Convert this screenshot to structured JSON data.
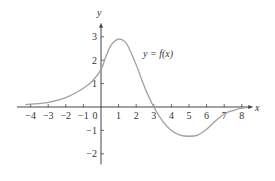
{
  "chart_data": {
    "type": "line",
    "title": "",
    "xlabel": "x",
    "ylabel": "y",
    "annotation": "y = f(x)",
    "xlim": [
      -4.5,
      8.5
    ],
    "ylim": [
      -2.5,
      3.6
    ],
    "grid": false,
    "x_ticks": [
      -4,
      -3,
      -2,
      -1,
      0,
      1,
      2,
      3,
      4,
      5,
      6,
      7,
      8
    ],
    "x_tick_labels": [
      "−4",
      "−3",
      "−2",
      "−1",
      "0",
      "1",
      "2",
      "3",
      "4",
      "5",
      "6",
      "7",
      "8"
    ],
    "y_ticks": [
      -2,
      -1,
      1,
      2,
      3
    ],
    "y_tick_labels": [
      "−2",
      "−1",
      "1",
      "2",
      "3"
    ],
    "series": [
      {
        "name": "y = f(x)",
        "color": "#a0a0a0",
        "x": [
          -4.3,
          -4,
          -3,
          -2,
          -1,
          -0.5,
          0,
          0.25,
          0.5,
          0.75,
          1,
          1.25,
          1.5,
          2,
          2.5,
          3,
          3.5,
          4,
          4.5,
          5,
          5.5,
          6,
          6.5,
          7,
          7.5,
          8,
          8.3
        ],
        "y": [
          0.1,
          0.12,
          0.2,
          0.4,
          0.8,
          1.1,
          1.6,
          2.1,
          2.55,
          2.8,
          2.9,
          2.85,
          2.65,
          1.8,
          0.8,
          0,
          -0.6,
          -1.0,
          -1.2,
          -1.25,
          -1.2,
          -0.95,
          -0.6,
          -0.3,
          -0.15,
          -0.05,
          -0.02
        ]
      }
    ]
  }
}
